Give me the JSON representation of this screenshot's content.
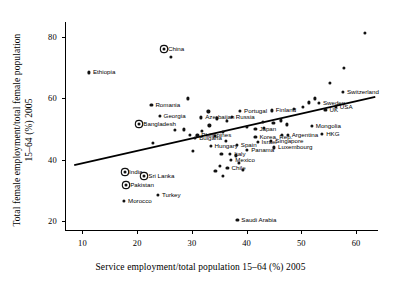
{
  "chart_data": {
    "type": "scatter",
    "title": "",
    "xlabel": "Service employment/total population 15–64 (%) 2005",
    "ylabel": "Total female employment/total female population\n15–64 (%) 2005",
    "xlim": [
      7,
      64
    ],
    "ylim": [
      17,
      85
    ],
    "xticks": [
      10,
      20,
      30,
      40,
      50,
      60
    ],
    "yticks": [
      20,
      40,
      60,
      80
    ],
    "grid": false,
    "legend": null,
    "trendline": {
      "x": [
        8.5,
        63.5
      ],
      "y": [
        38.2,
        60.5
      ],
      "style": "solid",
      "color": "#000000"
    },
    "marker_styles": {
      "plain": "filled-circle",
      "highlighted": "filled-circle-with-ring"
    },
    "points": [
      {
        "label": "Ethiopia",
        "x": 11.2,
        "y": 68.5,
        "highlighted": false,
        "label_side": "right"
      },
      {
        "label": "China",
        "x": 24.9,
        "y": 76.2,
        "highlighted": true,
        "label_side": "right"
      },
      {
        "label": "Romania",
        "x": 22.6,
        "y": 58.0,
        "highlighted": false,
        "label_side": "right"
      },
      {
        "label": "Georgia",
        "x": 24.1,
        "y": 54.2,
        "highlighted": false,
        "label_side": "right"
      },
      {
        "label": "Bangladesh",
        "x": 20.4,
        "y": 51.5,
        "highlighted": true,
        "label_side": "right"
      },
      {
        "label": "Bulgaria",
        "x": 30.6,
        "y": 47.0,
        "highlighted": false,
        "label_side": "right"
      },
      {
        "label": "Azerbaijan",
        "x": 31.7,
        "y": 53.8,
        "highlighted": false,
        "label_side": "right"
      },
      {
        "label": "Philippines",
        "x": 31.0,
        "y": 47.9,
        "highlighted": false,
        "label_side": "right"
      },
      {
        "label": "Hungary",
        "x": 33.4,
        "y": 44.6,
        "highlighted": false,
        "label_side": "right"
      },
      {
        "label": "Portugal",
        "x": 38.8,
        "y": 56.0,
        "highlighted": false,
        "label_side": "right"
      },
      {
        "label": "Russia",
        "x": 37.3,
        "y": 54.0,
        "highlighted": false,
        "label_side": "right"
      },
      {
        "label": "Finland",
        "x": 44.6,
        "y": 56.1,
        "highlighted": false,
        "label_side": "right"
      },
      {
        "label": "Japan",
        "x": 41.6,
        "y": 50.1,
        "highlighted": false,
        "label_side": "right"
      },
      {
        "label": "Spain",
        "x": 38.2,
        "y": 44.8,
        "highlighted": false,
        "label_side": "right"
      },
      {
        "label": "Italy",
        "x": 37.0,
        "y": 42.0,
        "highlighted": false,
        "label_side": "right"
      },
      {
        "label": "Panama",
        "x": 40.1,
        "y": 43.3,
        "highlighted": false,
        "label_side": "right"
      },
      {
        "label": "Mexico",
        "x": 37.2,
        "y": 40.0,
        "highlighted": false,
        "label_side": "right"
      },
      {
        "label": "Chile",
        "x": 36.5,
        "y": 37.2,
        "highlighted": false,
        "label_side": "right"
      },
      {
        "label": "Korea, Rep.",
        "x": 41.6,
        "y": 47.5,
        "highlighted": false,
        "label_side": "right"
      },
      {
        "label": "Israel",
        "x": 42.0,
        "y": 45.9,
        "highlighted": false,
        "label_side": "right"
      },
      {
        "label": "Singapore",
        "x": 44.5,
        "y": 46.0,
        "highlighted": false,
        "label_side": "right"
      },
      {
        "label": "Luxembourg",
        "x": 45.0,
        "y": 44.0,
        "highlighted": false,
        "label_side": "right"
      },
      {
        "label": "Argentina",
        "x": 47.5,
        "y": 48.0,
        "highlighted": false,
        "label_side": "right"
      },
      {
        "label": "Mongolia",
        "x": 51.9,
        "y": 51.0,
        "highlighted": false,
        "label_side": "right"
      },
      {
        "label": "HKG",
        "x": 53.8,
        "y": 48.5,
        "highlighted": false,
        "label_side": "right"
      },
      {
        "label": "Sweden",
        "x": 53.2,
        "y": 58.5,
        "highlighted": false,
        "label_side": "right"
      },
      {
        "label": "UK",
        "x": 54.4,
        "y": 56.3,
        "highlighted": false,
        "label_side": "right"
      },
      {
        "label": "USA",
        "x": 56.3,
        "y": 57.2,
        "highlighted": false,
        "label_side": "right"
      },
      {
        "label": "Switzerland",
        "x": 57.6,
        "y": 62.1,
        "highlighted": false,
        "label_side": "right"
      },
      {
        "label": "India",
        "x": 17.8,
        "y": 36.0,
        "highlighted": true,
        "label_side": "right"
      },
      {
        "label": "Sri Lanka",
        "x": 21.3,
        "y": 34.5,
        "highlighted": true,
        "label_side": "right"
      },
      {
        "label": "Pakistan",
        "x": 18.0,
        "y": 31.8,
        "highlighted": true,
        "label_side": "right"
      },
      {
        "label": "Turkey",
        "x": 23.8,
        "y": 28.5,
        "highlighted": false,
        "label_side": "right"
      },
      {
        "label": "Morocco",
        "x": 17.6,
        "y": 26.5,
        "highlighted": false,
        "label_side": "right"
      },
      {
        "label": "Saudi Arabia",
        "x": 38.3,
        "y": 20.2,
        "highlighted": false,
        "label_side": "right"
      },
      {
        "label": "",
        "x": 26.1,
        "y": 73.5,
        "highlighted": false,
        "label_side": "right"
      },
      {
        "label": "",
        "x": 29.3,
        "y": 60.0,
        "highlighted": false,
        "label_side": "right"
      },
      {
        "label": "",
        "x": 33.2,
        "y": 51.2,
        "highlighted": false,
        "label_side": "right"
      },
      {
        "label": "",
        "x": 28.5,
        "y": 49.9,
        "highlighted": false,
        "label_side": "right"
      },
      {
        "label": "",
        "x": 22.9,
        "y": 45.5,
        "highlighted": false,
        "label_side": "right"
      },
      {
        "label": "",
        "x": 26.9,
        "y": 49.7,
        "highlighted": false,
        "label_side": "right"
      },
      {
        "label": "",
        "x": 29.7,
        "y": 48.2,
        "highlighted": false,
        "label_side": "right"
      },
      {
        "label": "",
        "x": 31.9,
        "y": 49.3,
        "highlighted": false,
        "label_side": "right"
      },
      {
        "label": "",
        "x": 34.2,
        "y": 47.7,
        "highlighted": false,
        "label_side": "right"
      },
      {
        "label": "",
        "x": 35.7,
        "y": 49.0,
        "highlighted": false,
        "label_side": "right"
      },
      {
        "label": "",
        "x": 40.0,
        "y": 50.6,
        "highlighted": false,
        "label_side": "right"
      },
      {
        "label": "",
        "x": 43.2,
        "y": 50.5,
        "highlighted": false,
        "label_side": "right"
      },
      {
        "label": "",
        "x": 46.3,
        "y": 52.8,
        "highlighted": false,
        "label_side": "right"
      },
      {
        "label": "",
        "x": 47.3,
        "y": 51.5,
        "highlighted": false,
        "label_side": "right"
      },
      {
        "label": "",
        "x": 48.6,
        "y": 56.5,
        "highlighted": false,
        "label_side": "right"
      },
      {
        "label": "",
        "x": 50.3,
        "y": 57.3,
        "highlighted": false,
        "label_side": "right"
      },
      {
        "label": "",
        "x": 51.4,
        "y": 58.7,
        "highlighted": false,
        "label_side": "right"
      },
      {
        "label": "",
        "x": 52.4,
        "y": 60.0,
        "highlighted": false,
        "label_side": "right"
      },
      {
        "label": "",
        "x": 55.2,
        "y": 65.0,
        "highlighted": false,
        "label_side": "right"
      },
      {
        "label": "",
        "x": 57.7,
        "y": 70.0,
        "highlighted": false,
        "label_side": "right"
      },
      {
        "label": "",
        "x": 61.6,
        "y": 81.5,
        "highlighted": false,
        "label_side": "right"
      },
      {
        "label": "",
        "x": 46.5,
        "y": 48.0,
        "highlighted": false,
        "label_side": "right"
      },
      {
        "label": "",
        "x": 44.9,
        "y": 52.0,
        "highlighted": false,
        "label_side": "right"
      },
      {
        "label": "",
        "x": 42.9,
        "y": 52.3,
        "highlighted": false,
        "label_side": "right"
      },
      {
        "label": "",
        "x": 36.4,
        "y": 52.6,
        "highlighted": false,
        "label_side": "right"
      },
      {
        "label": "",
        "x": 34.6,
        "y": 53.5,
        "highlighted": false,
        "label_side": "right"
      },
      {
        "label": "",
        "x": 33.0,
        "y": 55.8,
        "highlighted": false,
        "label_side": "right"
      },
      {
        "label": "",
        "x": 36.2,
        "y": 46.0,
        "highlighted": false,
        "label_side": "right"
      },
      {
        "label": "",
        "x": 38.0,
        "y": 41.4,
        "highlighted": false,
        "label_side": "right"
      },
      {
        "label": "",
        "x": 35.4,
        "y": 41.8,
        "highlighted": false,
        "label_side": "right"
      },
      {
        "label": "",
        "x": 38.6,
        "y": 38.9,
        "highlighted": false,
        "label_side": "right"
      },
      {
        "label": "",
        "x": 35.1,
        "y": 38.0,
        "highlighted": false,
        "label_side": "right"
      },
      {
        "label": "",
        "x": 34.3,
        "y": 36.3,
        "highlighted": false,
        "label_side": "right"
      },
      {
        "label": "",
        "x": 35.6,
        "y": 34.8,
        "highlighted": false,
        "label_side": "right"
      },
      {
        "label": "",
        "x": 39.3,
        "y": 36.7,
        "highlighted": false,
        "label_side": "right"
      },
      {
        "label": "",
        "x": 30.2,
        "y": 42.9,
        "highlighted": false,
        "label_side": "right"
      }
    ]
  }
}
